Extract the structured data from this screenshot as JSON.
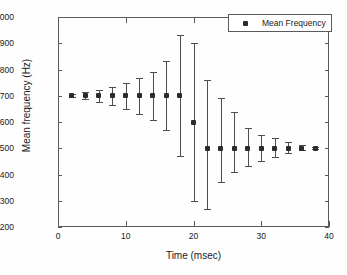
{
  "chart_data": {
    "type": "scatter",
    "title": "",
    "xlabel": "Time (msec)",
    "ylabel": "Mean frequency (Hz)",
    "xlim": [
      0,
      40
    ],
    "ylim": [
      1200,
      2000
    ],
    "xticks": [
      0,
      10,
      20,
      30,
      40
    ],
    "yticks": [
      1200,
      1300,
      1400,
      1500,
      1600,
      1700,
      1800,
      1900,
      2000
    ],
    "grid": false,
    "legend_position": "top-right",
    "marker_style": "asterisk",
    "series": [
      {
        "name": "Mean Frequency",
        "x": [
          2,
          4,
          6,
          8,
          10,
          12,
          14,
          16,
          18,
          20,
          22,
          24,
          26,
          28,
          30,
          32,
          34,
          36,
          38
        ],
        "values": [
          1700,
          1700,
          1700,
          1700,
          1700,
          1700,
          1700,
          1700,
          1700,
          1600,
          1500,
          1500,
          1500,
          1500,
          1500,
          1500,
          1500,
          1500,
          1500
        ],
        "err_low": [
          1694,
          1686,
          1678,
          1666,
          1650,
          1632,
          1609,
          1570,
          1470,
          1298,
          1270,
          1370,
          1408,
          1433,
          1453,
          1468,
          1482,
          1492,
          1497
        ],
        "err_high": [
          1706,
          1714,
          1722,
          1734,
          1750,
          1768,
          1791,
          1832,
          1930,
          1900,
          1760,
          1690,
          1640,
          1578,
          1550,
          1538,
          1524,
          1512,
          1505
        ]
      }
    ]
  },
  "legend": {
    "label": "Mean Frequency"
  },
  "axes": {
    "y_tick_labels": [
      "2000",
      "1900",
      "1800",
      "1700",
      "1600",
      "1500",
      "1400",
      "1300",
      "1200"
    ],
    "x_tick_labels": [
      "0",
      "10",
      "20",
      "30",
      "40"
    ],
    "x_title": "Time (msec)",
    "y_title": "Mean frequency (Hz)"
  }
}
